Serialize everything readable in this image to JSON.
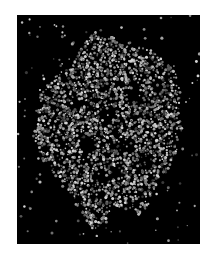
{
  "image": {
    "subject": "space-filling molecular structure rendering",
    "background_color": "#000000",
    "page_background": "#ffffff",
    "frame": {
      "x": 17,
      "y": 15,
      "width": 183,
      "height": 229
    },
    "atom_palette": [
      "#3a3a3a",
      "#555555",
      "#6e6e6e",
      "#888888",
      "#a2a2a2",
      "#bcbcbc",
      "#d4d4d4"
    ],
    "silhouette": [
      [
        78,
        16
      ],
      [
        88,
        24
      ],
      [
        96,
        22
      ],
      [
        104,
        30
      ],
      [
        116,
        26
      ],
      [
        124,
        34
      ],
      [
        132,
        30
      ],
      [
        140,
        40
      ],
      [
        150,
        42
      ],
      [
        158,
        52
      ],
      [
        160,
        66
      ],
      [
        164,
        80
      ],
      [
        162,
        96
      ],
      [
        166,
        112
      ],
      [
        162,
        128
      ],
      [
        158,
        142
      ],
      [
        150,
        156
      ],
      [
        140,
        168
      ],
      [
        132,
        190
      ],
      [
        122,
        200
      ],
      [
        112,
        196
      ],
      [
        96,
        190
      ],
      [
        88,
        206
      ],
      [
        76,
        216
      ],
      [
        66,
        200
      ],
      [
        56,
        186
      ],
      [
        48,
        170
      ],
      [
        38,
        160
      ],
      [
        28,
        148
      ],
      [
        18,
        136
      ],
      [
        16,
        120
      ],
      [
        20,
        104
      ],
      [
        18,
        88
      ],
      [
        28,
        72
      ],
      [
        40,
        60
      ],
      [
        52,
        52
      ],
      [
        60,
        40
      ],
      [
        68,
        28
      ]
    ],
    "cavities": [
      [
        90,
        100,
        10
      ],
      [
        120,
        80,
        8
      ],
      [
        70,
        130,
        9
      ],
      [
        110,
        130,
        8
      ],
      [
        140,
        70,
        7
      ],
      [
        60,
        90,
        6
      ],
      [
        100,
        160,
        7
      ],
      [
        130,
        150,
        6
      ]
    ],
    "atom_count": 2600,
    "seed": 7
  }
}
